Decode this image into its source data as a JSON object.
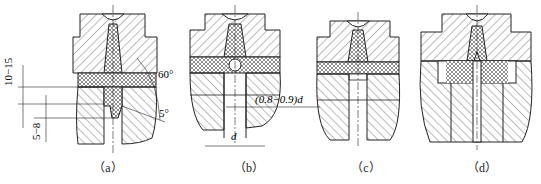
{
  "figure": {
    "panels": [
      {
        "id": "a",
        "caption": "（a）",
        "annotations": {
          "dim_upper": "10−15",
          "dim_lower": "5−8",
          "angle_upper": "60°",
          "angle_lower": "5°"
        }
      },
      {
        "id": "b",
        "caption": "（b）",
        "annotations": {
          "dim_diameter": "(0.8−0.9)d",
          "dim_d": "d"
        }
      },
      {
        "id": "c",
        "caption": "（c）",
        "annotations": {}
      },
      {
        "id": "d",
        "caption": "（d）",
        "annotations": {}
      }
    ],
    "colors": {
      "line": "#222222",
      "hatch": "#555555",
      "background": "#ffffff"
    }
  }
}
